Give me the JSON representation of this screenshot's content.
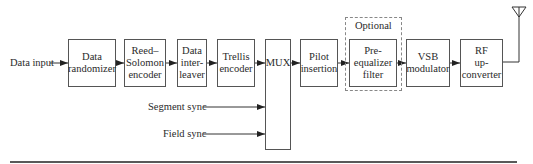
{
  "diagram": {
    "input_label": "Data input",
    "blocks": [
      {
        "id": "data-randomizer",
        "label": "Data\nrandomizer"
      },
      {
        "id": "reed-solomon-encoder",
        "label": "Reed–\nSolomon\nencoder"
      },
      {
        "id": "data-interleaver",
        "label": "Data\ninter-\nleaver"
      },
      {
        "id": "trellis-encoder",
        "label": "Trellis\nencoder"
      },
      {
        "id": "mux",
        "label": "MUX"
      },
      {
        "id": "pilot-insertion",
        "label": "Pilot\ninsertion"
      },
      {
        "id": "pre-equalizer-filter",
        "label": "Pre-\nequalizer\nfilter"
      },
      {
        "id": "vsb-modulator",
        "label": "VSB\nmodulator"
      },
      {
        "id": "rf-up-converter",
        "label": "RF\nup-\nconverter"
      }
    ],
    "optional_label": "Optional",
    "sync_inputs": [
      {
        "label": "Segment sync"
      },
      {
        "label": "Field sync"
      }
    ],
    "output": "antenna"
  }
}
